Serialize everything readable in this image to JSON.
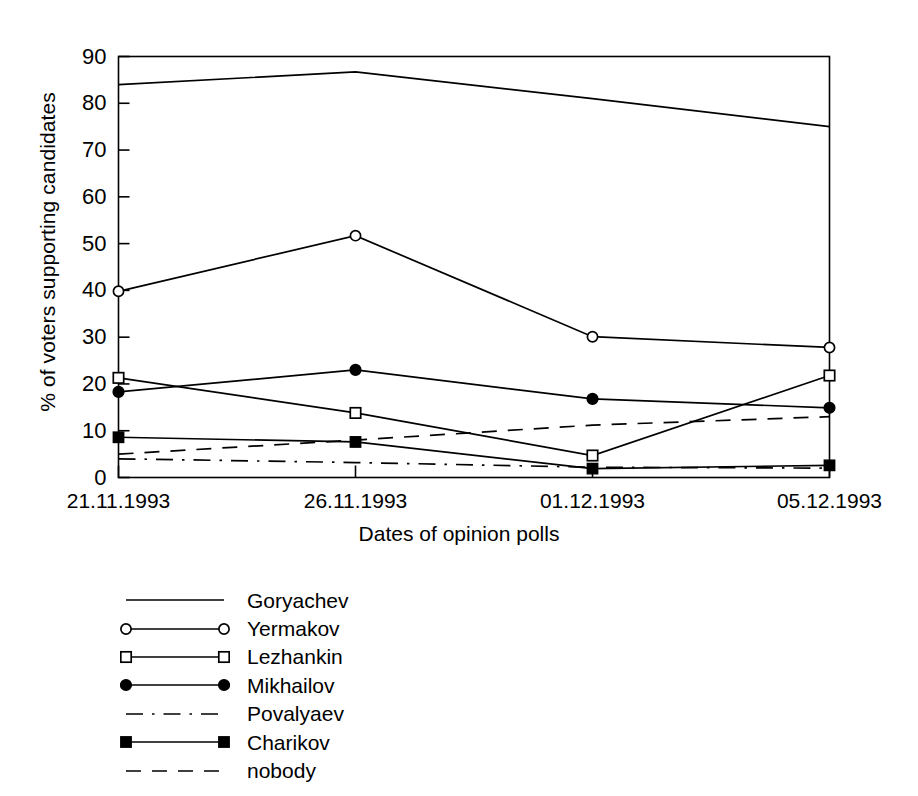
{
  "chart_data": {
    "type": "line",
    "title": "",
    "xlabel": "Dates of opinion polls",
    "ylabel": "% of voters supporting candidates",
    "categories": [
      "21.11.1993",
      "26.11.1993",
      "01.12.1993",
      "05.12.1993"
    ],
    "ylim": [
      0,
      90
    ],
    "yticks": [
      0,
      10,
      20,
      30,
      40,
      50,
      60,
      70,
      80,
      90
    ],
    "ytick_labels": [
      "0",
      "10",
      "20",
      "30",
      "40",
      "50",
      "60",
      "70",
      "80",
      "90"
    ],
    "grid": false,
    "legend_position": "below-left",
    "series": [
      {
        "name": "Goryachev",
        "values": [
          84.0,
          86.7,
          81.0,
          75.0
        ],
        "marker": "none",
        "linestyle": "solid"
      },
      {
        "name": "Yermakov",
        "values": [
          39.8,
          51.7,
          30.1,
          27.8
        ],
        "marker": "open-circle",
        "linestyle": "solid"
      },
      {
        "name": "Lezhankin",
        "values": [
          21.3,
          13.8,
          4.7,
          21.8
        ],
        "marker": "open-square",
        "linestyle": "solid"
      },
      {
        "name": "Mikhailov",
        "values": [
          18.3,
          23.0,
          16.8,
          14.9
        ],
        "marker": "filled-circle",
        "linestyle": "solid"
      },
      {
        "name": "Povalyaev",
        "values": [
          4.0,
          3.2,
          2.2,
          2.0
        ],
        "marker": "none",
        "linestyle": "dashdot"
      },
      {
        "name": "Charikov",
        "values": [
          8.6,
          7.6,
          1.9,
          2.6
        ],
        "marker": "filled-square",
        "linestyle": "solid"
      },
      {
        "name": "nobody",
        "values": [
          5.0,
          8.0,
          11.2,
          13.0
        ],
        "marker": "none",
        "linestyle": "dashed"
      }
    ]
  },
  "legend": {
    "items": [
      {
        "label": "Goryachev",
        "marker": "none",
        "linestyle": "solid"
      },
      {
        "label": "Yermakov",
        "marker": "open-circle",
        "linestyle": "solid"
      },
      {
        "label": "Lezhankin",
        "marker": "open-square",
        "linestyle": "solid"
      },
      {
        "label": "Mikhailov",
        "marker": "filled-circle",
        "linestyle": "solid"
      },
      {
        "label": "Povalyaev",
        "marker": "none",
        "linestyle": "dashdot"
      },
      {
        "label": "Charikov",
        "marker": "filled-square",
        "linestyle": "solid"
      },
      {
        "label": "nobody",
        "marker": "none",
        "linestyle": "dashed"
      }
    ]
  },
  "colors": {
    "line": "#000000",
    "axis": "#000000",
    "background": "#ffffff"
  }
}
